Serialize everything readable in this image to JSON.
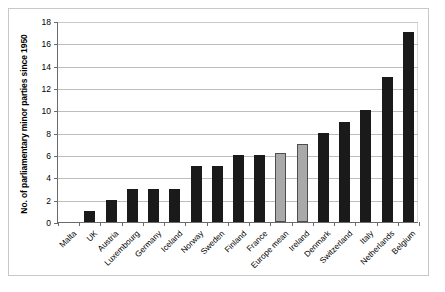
{
  "chart_data": {
    "type": "bar",
    "title": "",
    "xlabel": "",
    "ylabel": "No. of parliamentary minor parties since 1950",
    "ylim": [
      0,
      18
    ],
    "ytick_step": 2,
    "ytick_labels": [
      "0",
      "2",
      "4",
      "6",
      "8",
      "10",
      "12",
      "14",
      "16",
      "18"
    ],
    "grid": "horizontal",
    "legend": "none",
    "categories": [
      "Malta",
      "UK",
      "Austria",
      "Luxembourg",
      "Germany",
      "Iceland",
      "Norway",
      "Sweden",
      "Finland",
      "France",
      "Europe mean",
      "Ireland",
      "Denmark",
      "Switzerland",
      "Italy",
      "Netherlands",
      "Belgium"
    ],
    "values": [
      0,
      1,
      2,
      3,
      3,
      3,
      5,
      5,
      6,
      6,
      6.2,
      7,
      8,
      9,
      10,
      13,
      17
    ],
    "bar_colors": [
      "black",
      "black",
      "black",
      "black",
      "black",
      "black",
      "black",
      "black",
      "black",
      "black",
      "gray",
      "gray",
      "black",
      "black",
      "black",
      "black",
      "black"
    ],
    "colors": {
      "bar_black": "#1a1a1a",
      "bar_gray": "#a9a9a9",
      "bar_gray_outline": "#4d4d4d",
      "gridline": "#bdbdbd",
      "axis": "#6b6b6b",
      "frame": "#c8c8c8",
      "background": "#ffffff"
    }
  }
}
